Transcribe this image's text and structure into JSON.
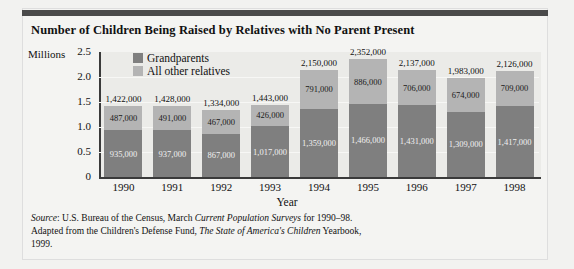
{
  "title": "Number of Children Being Raised by Relatives with No Parent Present",
  "axis": {
    "y_unit_label": "Millions",
    "x_title": "Year",
    "yticks": [
      "2.5",
      "2.0",
      "1.5",
      "1.0",
      "0.5",
      "0"
    ]
  },
  "legend": {
    "items": [
      {
        "label": "Grandparents",
        "color": "#7f7f7f"
      },
      {
        "label": "All other relatives",
        "color": "#b4b4b4"
      }
    ]
  },
  "source": {
    "prefix": "Source",
    "line1_a": ": U.S. Bureau of the Census, March ",
    "line1_italic": "Current Population",
    "line2_italic": "Surveys",
    "line2_a": " for 1990–98. Adapted from the Children's Defense Fund,",
    "line3_italic": "The State of America's Children",
    "line3_a": " Yearbook, 1999."
  },
  "colors": {
    "grandparents": "#7f7f7f",
    "other_relatives": "#b4b4b4",
    "plot_background": "#ebebe8",
    "axis": "#3a3a3a",
    "rule": "#4a4a4a"
  },
  "chart_data": {
    "type": "bar",
    "stacked": true,
    "title": "Number of Children Being Raised by Relatives with No Parent Present",
    "xlabel": "Year",
    "ylabel": "Millions",
    "ylim": [
      0,
      2.5
    ],
    "ytick_values": [
      0,
      0.5,
      1.0,
      1.5,
      2.0,
      2.5
    ],
    "grid": true,
    "legend_position": "top-left-inside",
    "categories": [
      "1990",
      "1991",
      "1992",
      "1993",
      "1994",
      "1995",
      "1996",
      "1997",
      "1998"
    ],
    "series": [
      {
        "name": "Grandparents",
        "color": "#7f7f7f",
        "values": [
          935000,
          937000,
          867000,
          1017000,
          1359000,
          1466000,
          1431000,
          1309000,
          1417000
        ],
        "labels": [
          "935,000",
          "937,000",
          "867,000",
          "1,017,000",
          "1,359,000",
          "1,466,000",
          "1,431,000",
          "1,309,000",
          "1,417,000"
        ]
      },
      {
        "name": "All other relatives",
        "color": "#b4b4b4",
        "values": [
          487000,
          491000,
          467000,
          426000,
          791000,
          886000,
          706000,
          674000,
          709000
        ],
        "labels": [
          "487,000",
          "491,000",
          "467,000",
          "426,000",
          "791,000",
          "886,000",
          "706,000",
          "674,000",
          "709,000"
        ]
      }
    ],
    "totals": [
      1422000,
      1428000,
      1334000,
      1443000,
      2150000,
      2352000,
      2137000,
      1983000,
      2126000
    ],
    "total_labels": [
      "1,422,000",
      "1,428,000",
      "1,334,000",
      "1,443,000",
      "2,150,000",
      "2,352,000",
      "2,137,000",
      "1,983,000",
      "2,126,000"
    ]
  }
}
